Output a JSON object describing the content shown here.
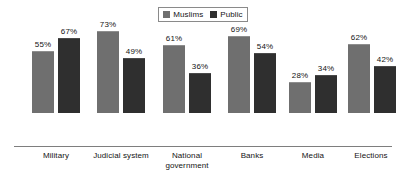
{
  "legend": {
    "entries": [
      {
        "label": "Muslims",
        "color": "#6f6f6f"
      },
      {
        "label": "Public",
        "color": "#2f2f2f"
      }
    ]
  },
  "chart_data": {
    "type": "bar",
    "title": "",
    "subtitle": "",
    "xlabel": "",
    "ylabel": "",
    "ylim": [
      0,
      100
    ],
    "grid": false,
    "legend_position": "top-center",
    "value_suffix": "%",
    "categories": [
      "Military",
      "Judicial system",
      "National\ngovernment",
      "Banks",
      "Media",
      "Elections"
    ],
    "series": [
      {
        "name": "Muslims",
        "color": "#6f6f6f",
        "values": [
          55,
          73,
          61,
          69,
          28,
          62
        ],
        "labels": [
          "55%",
          "73%",
          "61%",
          "69%",
          "28%",
          "62%"
        ]
      },
      {
        "name": "Public",
        "color": "#2f2f2f",
        "values": [
          67,
          49,
          36,
          54,
          34,
          42
        ],
        "labels": [
          "67%",
          "49%",
          "36%",
          "54%",
          "34%",
          "42%"
        ]
      }
    ]
  },
  "groups": [
    {
      "label": "Military",
      "left": 32,
      "label_left": 16,
      "label_width": 80,
      "bars": [
        {
          "series": "Muslims",
          "value": 55,
          "label": "55%"
        },
        {
          "series": "Public",
          "value": 67,
          "label": "67%"
        }
      ]
    },
    {
      "label": "Judicial system",
      "left": 97,
      "label_left": 78,
      "label_width": 86,
      "bars": [
        {
          "series": "Muslims",
          "value": 73,
          "label": "73%"
        },
        {
          "series": "Public",
          "value": 49,
          "label": "49%"
        }
      ]
    },
    {
      "label": "National\ngovernment",
      "left": 163,
      "label_left": 146,
      "label_width": 82,
      "bars": [
        {
          "series": "Muslims",
          "value": 61,
          "label": "61%"
        },
        {
          "series": "Public",
          "value": 36,
          "label": "36%"
        }
      ]
    },
    {
      "label": "Banks",
      "left": 228,
      "label_left": 212,
      "label_width": 80,
      "bars": [
        {
          "series": "Muslims",
          "value": 69,
          "label": "69%"
        },
        {
          "series": "Public",
          "value": 54,
          "label": "54%"
        }
      ]
    },
    {
      "label": "Media",
      "left": 289,
      "label_left": 273,
      "label_width": 80,
      "bars": [
        {
          "series": "Muslims",
          "value": 28,
          "label": "28%"
        },
        {
          "series": "Public",
          "value": 34,
          "label": "34%"
        }
      ]
    },
    {
      "label": "Elections",
      "left": 348,
      "label_left": 330,
      "label_width": 82,
      "bars": [
        {
          "series": "Muslims",
          "value": 62,
          "label": "62%"
        },
        {
          "series": "Public",
          "value": 42,
          "label": "42%"
        }
      ]
    }
  ]
}
